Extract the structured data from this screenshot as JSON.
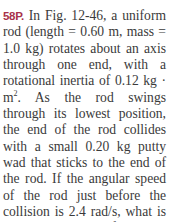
{
  "problem": {
    "label": "58P.",
    "segments": {
      "s1": " In Fig. 12-46, a uniform rod (length = 0.60 m, mass = 1.0 kg) rotates about an axis through one end, with a rotational inertia of 0.12 kg · m",
      "exp": "2",
      "s2": ". As the rod swings through its lowest posi­tion, the end of the rod collides with a small 0.20 kg putty wad that sticks to the end of the rod. If the angular speed of the rod just before the collision is 2.4 rad/s, what is the angular speed of the rod–putty system immediately after the collision?"
    },
    "values": {
      "figure": "Fig. 12-46",
      "rod_length": "0.60 m",
      "rod_mass": "1.0 kg",
      "rotational_inertia": "0.12 kg · m²",
      "putty_mass": "0.20 kg",
      "angular_speed_before": "2.4 rad/s"
    }
  }
}
